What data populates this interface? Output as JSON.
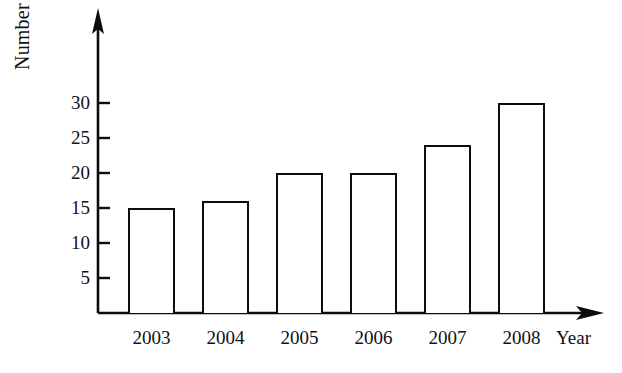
{
  "chart_data": {
    "type": "bar",
    "title": "",
    "xlabel": "Year",
    "ylabel": "Number of wardrobes sold",
    "categories": [
      "2003",
      "2004",
      "2005",
      "2006",
      "2007",
      "2008"
    ],
    "values": [
      15,
      16,
      20,
      20,
      24,
      30
    ],
    "series": [
      {
        "name": "Number of wardrobes sold",
        "values": [
          15,
          16,
          20,
          20,
          24,
          30
        ]
      }
    ],
    "ylim": [
      0,
      34
    ],
    "yticks": [
      5,
      10,
      15,
      20,
      25,
      30
    ],
    "ytick_labels": [
      "5",
      "10",
      "15",
      "20",
      "25",
      "30"
    ],
    "grid": false,
    "legend": false,
    "legend_position": "none",
    "bar_fill": "#ffffff",
    "bar_edge_color": "#0d0d0d",
    "background": "#ffffff",
    "axis_color": "#0d0d0d",
    "x_axis_arrow": true,
    "y_axis_arrow": true,
    "annotations": []
  },
  "axis": {
    "y_title": "Number of wardrobes sold",
    "x_title": "Year"
  }
}
